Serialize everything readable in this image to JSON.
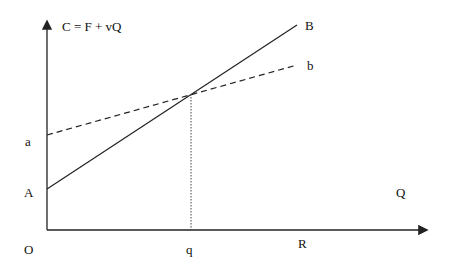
{
  "title": "C = F + vQ",
  "axes": {
    "origin_label": "O",
    "x_axis_label": "Q",
    "x_marks": {
      "q": "q",
      "R": "R"
    }
  },
  "lines": [
    {
      "id": "AB",
      "style": "solid",
      "start_label": "A",
      "end_label": "B"
    },
    {
      "id": "ab",
      "style": "dashed",
      "start_label": "a",
      "end_label": "b"
    }
  ],
  "intersection_drop": {
    "style": "dotted",
    "to_label": "q"
  },
  "colors": {
    "stroke": "#222222",
    "text": "#111111",
    "background": "#ffffff"
  }
}
